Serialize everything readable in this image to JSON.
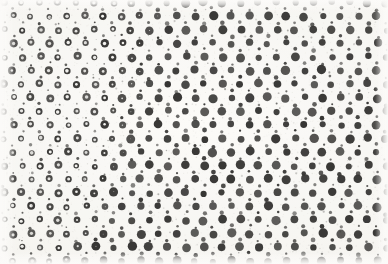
{
  "figure": {
    "medium": "printed halftone screen on paper, scanned",
    "width": 388,
    "height": 264
  },
  "colors": {
    "paper_light": "#fdfcfa",
    "paper_mid": "#f7f6f3",
    "paper_dark": "#f2f0ec",
    "ink": "#1d1c1b",
    "ink_soft": "#2e2c2a",
    "ink_faint": "#6e6a66",
    "grain": "#b9b4ad",
    "ring_center": "#fbfaf8"
  },
  "lattice": {
    "type": "offset-rectangular",
    "pitch_x": 18.2,
    "pitch_y": 13.6,
    "row_offset_fraction": 0.5,
    "primary_mark_diameter": 7.0,
    "secondary_mark_diameter": 2.4,
    "ring_inner_diameter": 3.0,
    "jitter_amplitude": 1.15,
    "size_variation": 0.22
  },
  "gradient": {
    "description": "Ring-to-solid transition follows a diagonal boundary; rings persist farther right near the top, solid dots encroach leftward toward the bottom.",
    "boundary_x_at_top": 150,
    "boundary_x_at_bottom": 82,
    "transition_width": 62,
    "left_state": "open-ring",
    "right_state": "solid-dot"
  },
  "margins": {
    "top": 10,
    "right": 8,
    "bottom": 10,
    "left": 11
  },
  "render": {
    "grain_density": 2600,
    "grain_opacity": 0.5,
    "speckle_count": 520,
    "seed": 20240517
  }
}
